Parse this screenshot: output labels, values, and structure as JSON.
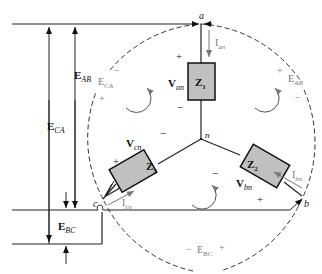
{
  "diagram": {
    "type": "Y-connected load with line voltages and phase currents",
    "nodes": {
      "a": "a",
      "b": "b",
      "c": "c",
      "n": "n"
    },
    "impedances": {
      "z1": {
        "main": "Z",
        "sub": "1"
      },
      "z2": {
        "main": "Z",
        "sub": "2"
      },
      "z3": {
        "main": "Z",
        "sub": "3"
      }
    },
    "phase_voltages": {
      "van": {
        "main": "V",
        "sub": "an"
      },
      "vbn": {
        "main": "V",
        "sub": "bn"
      },
      "vcn": {
        "main": "V",
        "sub": "cn"
      }
    },
    "phase_currents": {
      "ian": {
        "main": "I",
        "sub": "an"
      },
      "ibn": {
        "main": "I",
        "sub": "bn"
      },
      "icn": {
        "main": "I",
        "sub": "cn"
      }
    },
    "line_voltages_left": {
      "eab": {
        "main": "E",
        "sub": "AB"
      },
      "eca": {
        "main": "E",
        "sub": "CA"
      },
      "ebc": {
        "main": "E",
        "sub": "BC"
      }
    },
    "loop_voltages": {
      "eca": {
        "main": "E",
        "sub": "CA"
      },
      "eab": {
        "main": "E",
        "sub": "AB"
      },
      "ebc": {
        "main": "E",
        "sub": "BC"
      }
    },
    "signs": {
      "plus": "+",
      "minus": "−"
    },
    "colors": {
      "line": "#222222",
      "impedance_fill": "#c0c0c0",
      "gray_text": "#777777",
      "dashed": "#333333"
    }
  }
}
